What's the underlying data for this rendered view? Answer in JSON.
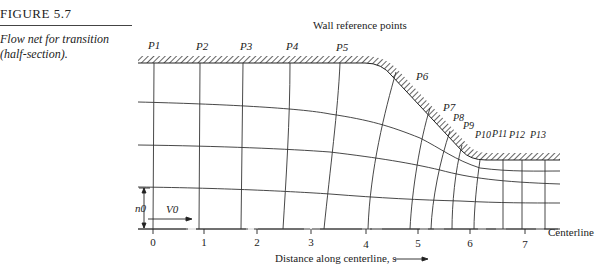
{
  "figure": {
    "number": "FIGURE 5.7",
    "caption_line1": "Flow net for transition",
    "caption_line2": "(half-section)."
  },
  "diagram": {
    "top_label": "Wall reference points",
    "wall_points": [
      "P1",
      "P2",
      "P3",
      "P4",
      "P5",
      "P6",
      "P7",
      "P8",
      "P9",
      "P10",
      "P11",
      "P12",
      "P13"
    ],
    "centerline_label": "Centerline",
    "axis_label": "Distance along centerline, s",
    "ticks": [
      "0",
      "1",
      "2",
      "3",
      "4",
      "5",
      "6",
      "7"
    ],
    "n0_label": "n0",
    "v0_label": "V0"
  }
}
